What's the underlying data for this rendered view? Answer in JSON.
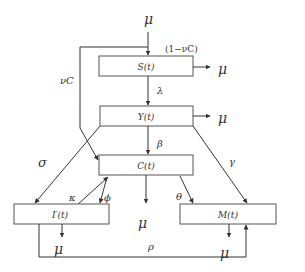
{
  "diagram": {
    "type": "compartmental-flow-model",
    "compartments": [
      {
        "id": "S",
        "label": "S(t)"
      },
      {
        "id": "Y",
        "label": "Y(t)"
      },
      {
        "id": "C",
        "label": "C(t)"
      },
      {
        "id": "I",
        "label": "I′(t)"
      },
      {
        "id": "M",
        "label": "M(t)"
      }
    ],
    "labels": {
      "inflow_mu": "μ",
      "one_minus_nuC": "(1−νC)",
      "nuC": "νC",
      "lambda": "λ",
      "beta": "β",
      "sigma": "σ",
      "gamma": "γ",
      "kappa": "κ",
      "phi": "ϕ",
      "theta": "θ",
      "rho": "ρ",
      "mu_S": "μ",
      "mu_Y": "μ",
      "mu_C": "μ",
      "mu_I": "μ",
      "mu_M": "μ"
    },
    "edges": [
      {
        "from": "external",
        "to": "S",
        "label": "μ"
      },
      {
        "from": "C",
        "to": "S",
        "label": "νC"
      },
      {
        "from": "S",
        "to": "out",
        "label": "μ"
      },
      {
        "from": "S",
        "to": "Y",
        "label": "λ"
      },
      {
        "from": "Y",
        "to": "out",
        "label": "μ"
      },
      {
        "from": "Y",
        "to": "C",
        "label": "β"
      },
      {
        "from": "Y",
        "to": "I",
        "label": "σ"
      },
      {
        "from": "Y",
        "to": "M",
        "label": "γ"
      },
      {
        "from": "I",
        "to": "C",
        "label": "κ"
      },
      {
        "from": "C",
        "to": "I",
        "label": "ϕ"
      },
      {
        "from": "C",
        "to": "out",
        "label": "μ"
      },
      {
        "from": "C",
        "to": "M",
        "label": "θ"
      },
      {
        "from": "I",
        "to": "out",
        "label": "μ"
      },
      {
        "from": "M",
        "to": "out",
        "label": "μ"
      },
      {
        "from": "I",
        "to": "M",
        "label": "ρ"
      }
    ]
  }
}
